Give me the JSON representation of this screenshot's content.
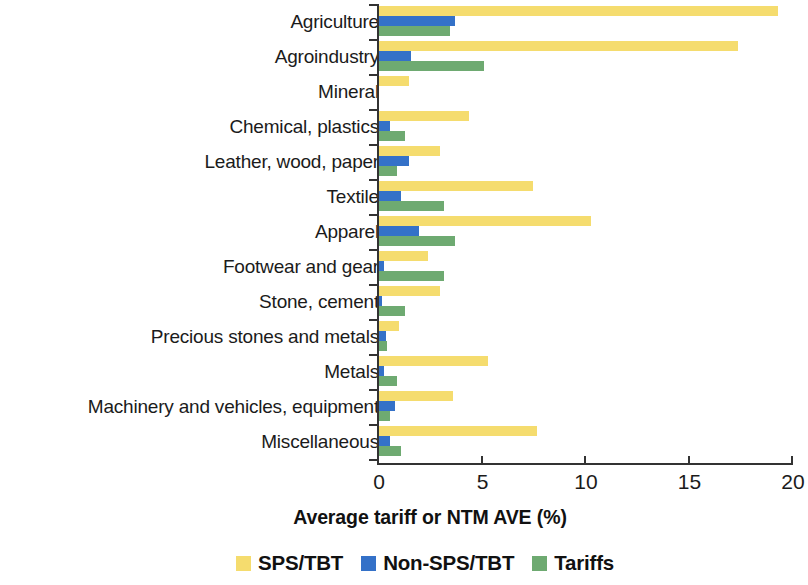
{
  "chart_data": {
    "type": "bar",
    "orientation": "horizontal",
    "title": "",
    "xlabel": "Average tariff or NTM AVE (%)",
    "ylabel": "",
    "xlim": [
      0,
      20
    ],
    "xticks": [
      0,
      5,
      10,
      15,
      20
    ],
    "xtick_labels": [
      "0",
      "5",
      "10",
      "15",
      "20"
    ],
    "grid": false,
    "legend_position": "bottom",
    "categories": [
      "Agriculture",
      "Agroindustry",
      "Mineral",
      "Chemical, plastics",
      "Leather, wood, paper",
      "Textile",
      "Apparel",
      "Footwear and gear",
      "Stone, cement",
      "Precious stones and metals",
      "Metals",
      "Machinery and vehicles, equipment",
      "Miscellaneous"
    ],
    "series": [
      {
        "name": "SPS/TBT",
        "color": "#F5DC6E",
        "values": [
          19.3,
          17.4,
          1.5,
          4.4,
          3.0,
          7.5,
          10.3,
          2.4,
          3.0,
          1.0,
          5.3,
          3.6,
          7.7
        ]
      },
      {
        "name": "Non-SPS/TBT",
        "color": "#3471C8",
        "values": [
          3.7,
          1.6,
          0.05,
          0.6,
          1.5,
          1.1,
          2.0,
          0.3,
          0.2,
          0.4,
          0.3,
          0.8,
          0.6
        ]
      },
      {
        "name": "Tariffs",
        "color": "#6EAA71",
        "values": [
          3.5,
          5.1,
          0.05,
          1.3,
          0.9,
          3.2,
          3.7,
          3.2,
          1.3,
          0.45,
          0.9,
          0.6,
          1.1
        ]
      }
    ]
  },
  "axis": {
    "x_title": "Average tariff or NTM AVE (%)"
  },
  "legend": {
    "items": [
      {
        "label": "SPS/TBT",
        "color": "#F5DC6E"
      },
      {
        "label": "Non-SPS/TBT",
        "color": "#3471C8"
      },
      {
        "label": "Tariffs",
        "color": "#6EAA71"
      }
    ]
  }
}
